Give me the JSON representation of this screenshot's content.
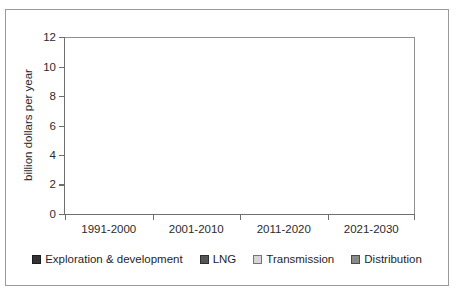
{
  "chart_data": {
    "type": "bar",
    "subtype": "stacked-bar",
    "title": "",
    "xlabel": "",
    "ylabel": "billion dollars per year",
    "ylim": [
      0,
      12
    ],
    "yticks": [
      0,
      2,
      4,
      6,
      8,
      10,
      12
    ],
    "ytick_labels": [
      "0",
      "2",
      "4",
      "6",
      "8",
      "10",
      "12"
    ],
    "grid": false,
    "legend_position": "bottom",
    "categories": [
      "1991-2000",
      "2001-2010",
      "2011-2020",
      "2021-2030"
    ],
    "series": [
      {
        "name": "Exploration & development",
        "color": "#333333",
        "values": [
          2.0,
          2.8,
          5.0,
          7.55
        ]
      },
      {
        "name": "LNG",
        "color": "#565656",
        "values": [
          0.45,
          0.95,
          0.75,
          0.65
        ]
      },
      {
        "name": "Transmission",
        "color": "#d5d5d5",
        "values": [
          0.5,
          0.9,
          0.9,
          1.45
        ]
      },
      {
        "name": "Distribution",
        "color": "#8a8a8a",
        "values": [
          0.15,
          0.15,
          0.2,
          0.25
        ]
      }
    ],
    "totals": [
      3.1,
      4.8,
      6.85,
      9.9
    ]
  },
  "axis": {
    "y_title": "billion dollars per year",
    "tick_0": "0",
    "tick_2": "2",
    "tick_4": "4",
    "tick_6": "6",
    "tick_8": "8",
    "tick_10": "10",
    "tick_12": "12"
  },
  "categories": {
    "cat_0": "1991-2000",
    "cat_1": "2001-2010",
    "cat_2": "2011-2020",
    "cat_3": "2021-2030"
  },
  "legend": {
    "item_0": "Exploration & development",
    "item_1": "LNG",
    "item_2": "Transmission",
    "item_3": "Distribution"
  },
  "colors": {
    "exploration": "#333333",
    "lng": "#565656",
    "transmission": "#d5d5d5",
    "distribution": "#8a8a8a",
    "axis": "#6e6e6e",
    "frame": "#9a9a9a"
  }
}
